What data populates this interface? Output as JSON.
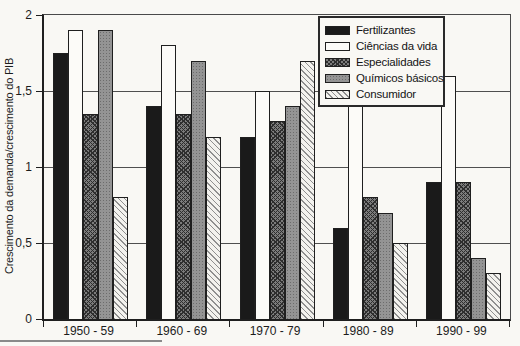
{
  "page": {
    "background": "#f9f8f4"
  },
  "chart_data": {
    "type": "bar",
    "title": "",
    "xlabel": "",
    "ylabel": "Crescimento da demanda/crescimento do PIB",
    "ylim": [
      0,
      2
    ],
    "grid": true,
    "legend_position": "top-right",
    "yticks": [
      {
        "label": "2",
        "value": 2
      },
      {
        "label": "1,5",
        "value": 1.5
      },
      {
        "label": "1",
        "value": 1
      },
      {
        "label": "0,5",
        "value": 0.5
      },
      {
        "label": "0",
        "value": 0
      }
    ],
    "gridline_values": [
      1.5,
      1,
      0.5
    ],
    "categories": [
      "1950 - 59",
      "1960 - 69",
      "1970 - 79",
      "1980 - 89",
      "1990 - 99"
    ],
    "series": [
      {
        "name": "Fertilizantes",
        "pattern": "solid-black",
        "values": [
          1.75,
          1.4,
          1.2,
          0.6,
          0.9
        ]
      },
      {
        "name": "Ciências da vida",
        "pattern": "white",
        "values": [
          1.9,
          1.8,
          1.5,
          1.4,
          1.6
        ]
      },
      {
        "name": "Especialidades",
        "pattern": "dark-crosshatch",
        "values": [
          1.35,
          1.35,
          1.3,
          0.8,
          0.9
        ]
      },
      {
        "name": "Químicos básicos",
        "pattern": "gray-dotted",
        "values": [
          1.9,
          1.7,
          1.4,
          0.7,
          0.4
        ]
      },
      {
        "name": "Consumidor",
        "pattern": "light-diagonal-hatch",
        "values": [
          0.8,
          1.2,
          1.7,
          0.5,
          0.3
        ]
      }
    ],
    "pattern_colors": {
      "solid-black": "#1a1a1a",
      "white": "#fcfbf8",
      "dark-crosshatch": "#5a5a5a",
      "gray-dotted": "#949494",
      "light-diagonal-hatch": "#e4e3df"
    }
  }
}
